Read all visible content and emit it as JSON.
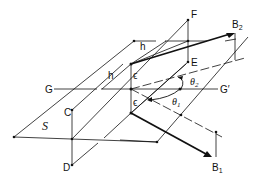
{
  "figure": {
    "type": "geometric-diagram",
    "colors": {
      "ink": "#111111",
      "background": "#ffffff"
    }
  },
  "labels": {
    "F": "F",
    "E": "E",
    "C": "C",
    "D": "D",
    "G": "G",
    "G_prime": "G′",
    "S": "S",
    "h_upper": "h",
    "h_lower": "h",
    "eps_upper": "ϵ",
    "eps_lower": "ϵ",
    "theta2": "θ",
    "theta2_sub": "2",
    "theta1": "θ",
    "theta1_sub": "1",
    "B2": "B",
    "B2_sub": "2",
    "B1": "B",
    "B1_sub": "1"
  }
}
